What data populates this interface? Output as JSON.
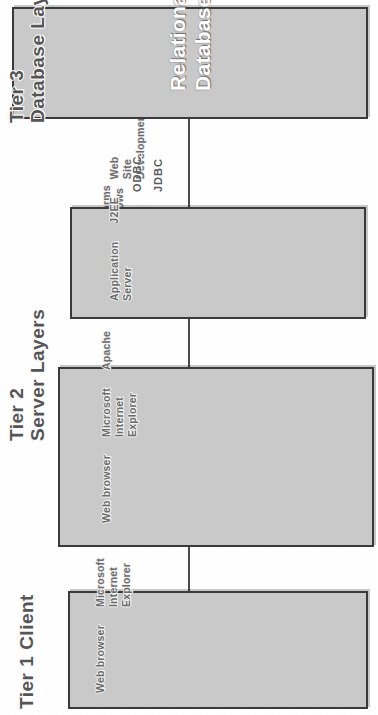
{
  "diagram": {
    "box_fill_color": "#c9c9c9",
    "box_border_color": "#3a3a3a",
    "text_color": "#6d6d6d",
    "heading_color": "#555555",
    "connector_color": "#4b4b4b"
  },
  "tiers": [
    {
      "id": "tier1",
      "heading_line1": "Tier 1 Client",
      "heading_line2": "",
      "groups": [
        {
          "name": "browser-role",
          "lines": [
            "Web browser"
          ]
        },
        {
          "name": "ie-browser",
          "lines": [
            "Microsoft",
            "Internet",
            "Explorer"
          ]
        },
        {
          "name": "other-browsers",
          "lines": [
            "Netscape",
            "Foxfire",
            "Opera"
          ]
        },
        {
          "name": "software-modules",
          "lines": [
            "Software",
            "Modules",
            "HTML",
            "Java applets",
            "VBScript",
            "ActiveX"
          ]
        }
      ]
    },
    {
      "id": "tier2-web",
      "heading_line1": "",
      "heading_line2": "",
      "groups": [
        {
          "name": "server-role",
          "lines": [
            "Web browser"
          ]
        },
        {
          "name": "ms-server",
          "lines": [
            "Microsoft",
            "Internet",
            "Explorer"
          ]
        },
        {
          "name": "apache",
          "lines": [
            "Apache"
          ]
        },
        {
          "name": "scripting",
          "lines": [
            "CGI Scripts",
            "VB Scripts"
          ]
        },
        {
          "name": "platforms",
          "lines": [
            "Platforms",
            "Windows",
            "Unix",
            "Linux"
          ]
        }
      ]
    },
    {
      "id": "tier2-app",
      "heading_line1": "Tier 2",
      "heading_line2": "Server Layers",
      "groups": [
        {
          "name": "app-server-role",
          "lines": [
            "Application",
            "Server"
          ]
        },
        {
          "name": "j2ee",
          "lines": [
            "J2EE"
          ]
        },
        {
          "name": "web-site-dev",
          "lines": [
            "Web",
            "Site",
            "Development"
          ]
        },
        {
          "name": "platforms",
          "lines": [
            "Platforms",
            "Windows",
            "Unix",
            "Linux"
          ]
        }
      ]
    },
    {
      "id": "tier3",
      "heading_line1": "Tier 3",
      "heading_line2": "Database Layer",
      "big_lines": [
        "Relational",
        "Database"
      ],
      "groups": []
    }
  ],
  "connectors": [
    {
      "name": "tier1-to-web",
      "labels": []
    },
    {
      "name": "web-to-app",
      "labels": []
    },
    {
      "name": "app-to-db",
      "labels": [
        "JDBC",
        "ODBC"
      ]
    }
  ],
  "protocols": {
    "jdbc": "JDBC",
    "odbc": "ODBC"
  }
}
